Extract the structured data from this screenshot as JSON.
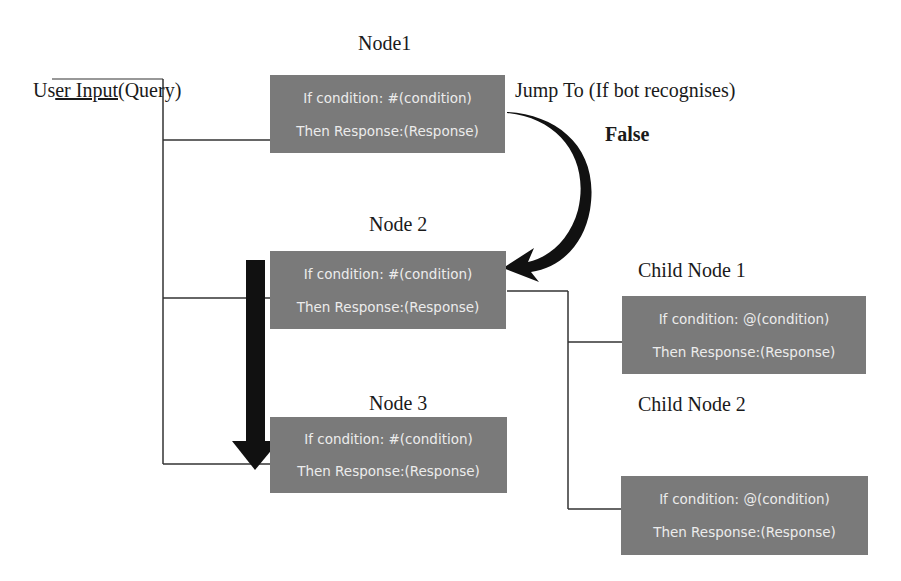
{
  "labels": {
    "user_input_prefix": "Us",
    "user_input_underlined": "er Input",
    "user_input_suffix": "(Query)",
    "node1_title": "Node1",
    "node2_title": "Node 2",
    "node3_title": "Node 3",
    "child1_title": "Child Node 1",
    "child2_title": "Child Node 2",
    "jump_to": "Jump To (If bot recognises)",
    "false_label": "False"
  },
  "nodes": {
    "node1": {
      "condition": "If condition: #(condition)",
      "response": "Then Response:(Response)"
    },
    "node2": {
      "condition": "If condition: #(condition)",
      "response": "Then Response:(Response)"
    },
    "node3": {
      "condition": "If condition: #(condition)",
      "response": "Then Response:(Response)"
    },
    "child1": {
      "condition": "If condition: @(condition)",
      "response": "Then Response:(Response)"
    },
    "child2": {
      "condition": "If condition: @(condition)",
      "response": "Then Response:(Response)"
    }
  },
  "colors": {
    "node_fill": "#7a7a7a",
    "node_text": "#ececec",
    "line": "#333333",
    "arrow": "#111111"
  }
}
